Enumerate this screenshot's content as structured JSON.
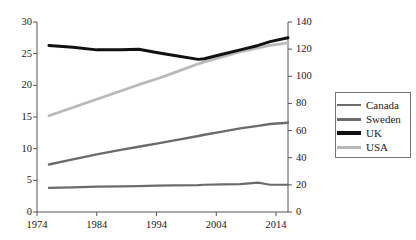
{
  "chart_data": {
    "type": "line",
    "title": "",
    "xlabel": "",
    "ylabel": "",
    "ylabel_right": "",
    "grid": false,
    "legend_position": "right-outside",
    "xlim": [
      1974,
      2016
    ],
    "xticks": [
      1974,
      1984,
      1994,
      2004,
      2014
    ],
    "xtick_labels": [
      "1974",
      "1984",
      "1994",
      "2004",
      "2014"
    ],
    "ylim": [
      0,
      30
    ],
    "yticks": [
      0,
      5,
      10,
      15,
      20,
      25,
      30
    ],
    "ytick_labels": [
      "0",
      "5",
      "10",
      "15",
      "20",
      "25",
      "30"
    ],
    "ylim_right": [
      0,
      140
    ],
    "yticks_right": [
      0,
      20,
      40,
      60,
      80,
      100,
      120,
      140
    ],
    "ytick_labels_right": [
      "0",
      "20",
      "40",
      "60",
      "80",
      "100",
      "120",
      "140"
    ],
    "x": [
      1976,
      1980,
      1984,
      1988,
      1991,
      1994,
      1997,
      2001,
      2002,
      2005,
      2008,
      2011,
      2013,
      2016
    ],
    "series": [
      {
        "name": "Canada",
        "axis": "left",
        "color": "#6b6b6b",
        "width": 2.2,
        "values": [
          3.8,
          3.9,
          4.0,
          4.05,
          4.1,
          4.15,
          4.2,
          4.25,
          4.3,
          4.35,
          4.4,
          4.65,
          4.3,
          4.3
        ]
      },
      {
        "name": "Sweden",
        "axis": "left",
        "color": "#6b6b6b",
        "width": 2.4,
        "values": [
          7.5,
          8.3,
          9.1,
          9.8,
          10.3,
          10.8,
          11.3,
          12.0,
          12.2,
          12.7,
          13.2,
          13.6,
          13.9,
          14.1
        ]
      },
      {
        "name": "UK",
        "axis": "left",
        "color": "#111111",
        "width": 3.0,
        "values": [
          26.3,
          26.0,
          25.6,
          25.6,
          25.7,
          25.2,
          24.7,
          24.1,
          24.2,
          24.9,
          25.6,
          26.3,
          26.9,
          27.5
        ]
      },
      {
        "name": "USA",
        "axis": "left",
        "color": "#b9b9b9",
        "width": 2.8,
        "values": [
          15.2,
          16.5,
          17.8,
          19.1,
          20.1,
          21.0,
          22.0,
          23.4,
          23.7,
          24.5,
          25.3,
          25.9,
          26.3,
          26.7
        ]
      }
    ]
  },
  "legend": {
    "items": [
      {
        "label": "Canada",
        "color": "#6b6b6b",
        "thickness": 2
      },
      {
        "label": "Sweden",
        "color": "#6b6b6b",
        "thickness": 3
      },
      {
        "label": "UK",
        "color": "#111111",
        "thickness": 4
      },
      {
        "label": "USA",
        "color": "#b9b9b9",
        "thickness": 3
      }
    ]
  },
  "axes": {
    "spine_color": "#555555",
    "background": "#ffffff"
  }
}
